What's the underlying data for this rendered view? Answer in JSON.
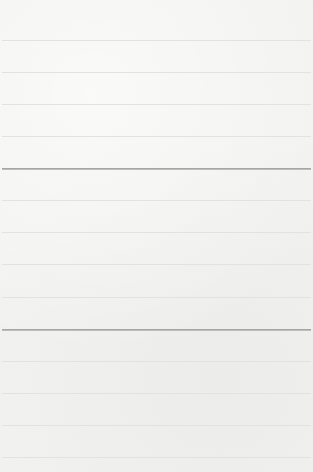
{
  "image": {
    "description": "Blank lined paper texture",
    "colors": {
      "paper": "#f2f2f0",
      "light_line": "#e2e2e0",
      "dark_line": "#9a9a9a"
    },
    "lines": [
      {
        "y": 40,
        "type": "light"
      },
      {
        "y": 72,
        "type": "light"
      },
      {
        "y": 104,
        "type": "light"
      },
      {
        "y": 136,
        "type": "light"
      },
      {
        "y": 168,
        "type": "dark"
      },
      {
        "y": 200,
        "type": "light"
      },
      {
        "y": 232,
        "type": "light"
      },
      {
        "y": 264,
        "type": "light"
      },
      {
        "y": 297,
        "type": "light"
      },
      {
        "y": 329,
        "type": "dark"
      },
      {
        "y": 361,
        "type": "light"
      },
      {
        "y": 393,
        "type": "light"
      },
      {
        "y": 425,
        "type": "light"
      },
      {
        "y": 457,
        "type": "light"
      }
    ]
  }
}
